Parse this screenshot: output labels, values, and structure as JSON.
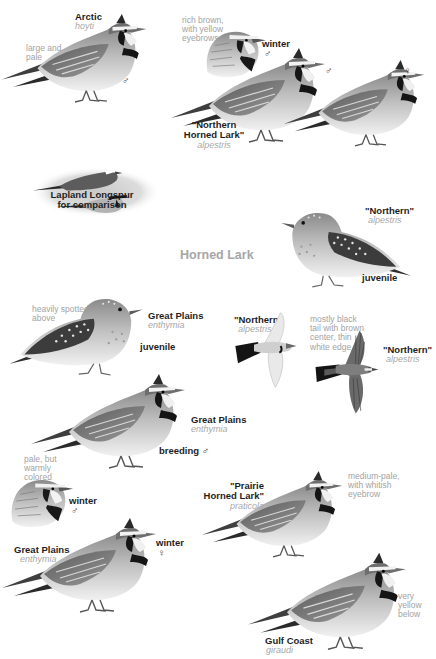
{
  "plate": {
    "title": "Horned Lark",
    "colors": {
      "background": "#ffffff",
      "label_dark": "#1e1e1e",
      "label_light": "#a8a8a8",
      "title": "#a6a6a6"
    }
  },
  "figures": [
    {
      "id": "arctic",
      "name": "Arctic",
      "subspecies": "hoyti",
      "note": "large and pale",
      "sex": "♂"
    },
    {
      "id": "northern-winter",
      "age": "winter",
      "sex": "♂",
      "note": "rich brown, with yellow eyebrows"
    },
    {
      "id": "northern-male",
      "sex": "♂"
    },
    {
      "id": "northern-female",
      "sex": "♀"
    },
    {
      "id": "northern-horned-lark",
      "name_line1": "\"Northern",
      "name_line2": "Horned Lark\"",
      "subspecies": "alpestris"
    },
    {
      "id": "lapland-longspur",
      "name_line1": "Lapland Longspur",
      "name_line2": "for comparison"
    },
    {
      "id": "northern-juvenile",
      "name": "\"Northern\"",
      "subspecies": "alpestris",
      "age": "juvenile"
    },
    {
      "id": "great-plains-juvenile",
      "name": "Great Plains",
      "subspecies": "enthymia",
      "age": "juvenile",
      "note": "heavily spotted above"
    },
    {
      "id": "northern-flight-pale",
      "name": "\"Northern\"",
      "subspecies": "alpestris",
      "note": "mostly black tail with brown center, thin white edge"
    },
    {
      "id": "northern-flight-dark",
      "name": "\"Northern\"",
      "subspecies": "alpestris"
    },
    {
      "id": "great-plains-breeding",
      "name": "Great Plains",
      "subspecies": "enthymia",
      "age": "breeding",
      "sex": "♂"
    },
    {
      "id": "great-plains-winter-male",
      "age": "winter",
      "sex": "♂",
      "note": "pale, but warmly colored"
    },
    {
      "id": "great-plains-winter-female",
      "name": "Great Plains",
      "subspecies": "enthymia",
      "age": "winter",
      "sex": "♀"
    },
    {
      "id": "prairie-horned-lark",
      "name_line1": "\"Prairie",
      "name_line2": "Horned Lark\"",
      "subspecies": "praticola",
      "note": "medium-pale, with whitish eyebrow"
    },
    {
      "id": "gulf-coast",
      "name": "Gulf Coast",
      "subspecies": "giraudi",
      "note": "very yellow below"
    }
  ]
}
